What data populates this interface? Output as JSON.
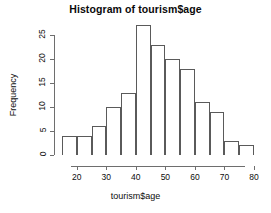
{
  "chart_data": {
    "type": "bar",
    "title": "Histogram of tourism$age",
    "xlabel": "tourism$age",
    "ylabel": "Frequency",
    "bin_width": 5,
    "bin_edges": [
      15,
      20,
      25,
      30,
      35,
      40,
      45,
      50,
      55,
      60,
      65,
      70,
      75,
      80
    ],
    "categories": [
      "15-20",
      "20-25",
      "25-30",
      "30-35",
      "35-40",
      "40-45",
      "45-50",
      "50-55",
      "55-60",
      "60-65",
      "65-70",
      "70-75",
      "75-80"
    ],
    "values": [
      4,
      4,
      6,
      10,
      13,
      27,
      23,
      20,
      18,
      11,
      9,
      3,
      2
    ],
    "xlim": [
      15,
      80
    ],
    "ylim": [
      0,
      27
    ],
    "xticks": [
      20,
      30,
      40,
      50,
      60,
      70,
      80
    ],
    "yticks": [
      0,
      5,
      10,
      15,
      20,
      25
    ],
    "grid": false,
    "legend": null,
    "bar_fill": "#ffffff",
    "bar_border": "#5a5a5a",
    "axis_color": "#6e6e6e",
    "text_color": "#0d0d0d",
    "background": "#ffffff"
  }
}
